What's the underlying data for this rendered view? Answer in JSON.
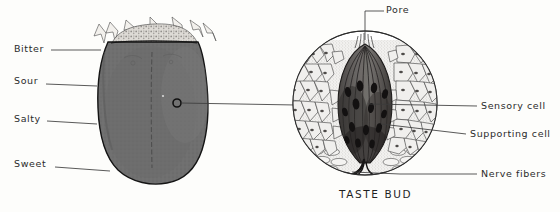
{
  "figure": {
    "background_color": "#fdfdfb",
    "ink_color": "#2b2b2b"
  },
  "tongue_diagram": {
    "name": "tongue",
    "description": "Dorsal view of the tongue with taste region labels",
    "fill_color": "#6e6e6e",
    "outline_color": "#1a1a1a",
    "root_fill_color": "#d8d6d2",
    "labels": [
      {
        "id": "bitter",
        "text": "Bitter",
        "x": 14,
        "y": 44,
        "leader_to_x": 98,
        "leader_to_y": 50
      },
      {
        "id": "sour",
        "text": "Sour",
        "x": 14,
        "y": 76,
        "leader_to_x": 93,
        "leader_to_y": 86
      },
      {
        "id": "salty",
        "text": "Salty",
        "x": 14,
        "y": 114,
        "leader_to_x": 93,
        "leader_to_y": 124
      },
      {
        "id": "sweet",
        "text": "Sweet",
        "x": 14,
        "y": 159,
        "leader_to_x": 106,
        "leader_to_y": 170
      }
    ],
    "taste_bud_marker": {
      "x": 177,
      "y": 103,
      "radius": 4
    }
  },
  "taste_bud_diagram": {
    "name": "taste-bud",
    "caption": "TASTE BUD",
    "circle": {
      "cx": 365,
      "cy": 103,
      "r": 72
    },
    "epithelium_fill": "#efeeec",
    "bud_fill": "#5d5a58",
    "bud_dark": "#262322",
    "labels": [
      {
        "id": "pore",
        "text": "Pore",
        "x": 386,
        "y": 5,
        "leader_to_x": 365,
        "leader_to_y": 40
      },
      {
        "id": "sensory-cell",
        "text": "Sensory cell",
        "x": 481,
        "y": 101,
        "leader_to_x": 367,
        "leader_to_y": 101
      },
      {
        "id": "supporting-cell",
        "text": "Supporting cell",
        "x": 470,
        "y": 129,
        "leader_to_x": 376,
        "leader_to_y": 126
      },
      {
        "id": "nerve-fibers",
        "text": "Nerve fibers",
        "x": 481,
        "y": 169,
        "leader_to_x": 352,
        "leader_to_y": 171
      }
    ]
  },
  "connector": {
    "name": "tongue-to-tastebud-connector",
    "from_x": 181,
    "from_y": 103,
    "to_x": 296,
    "to_y": 105
  }
}
